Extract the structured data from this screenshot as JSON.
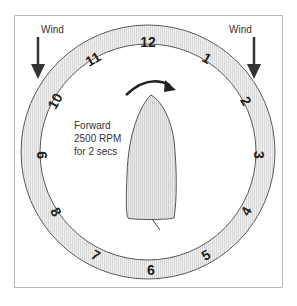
{
  "diagram": {
    "wind_left_label": "Wind",
    "wind_right_label": "Wind",
    "instruction_line1": "Forward",
    "instruction_line2": "2500 RPM",
    "instruction_line3": "for 2 secs",
    "clock_numbers": [
      "12",
      "1",
      "2",
      "3",
      "4",
      "5",
      "6",
      "7",
      "8",
      "9",
      "10",
      "11"
    ],
    "colors": {
      "ring_fill": "#e6e6e6",
      "ring_stroke": "#555555",
      "boat_fill": "#e2e2e2",
      "arrow": "#222222",
      "frame": "#b0b0b0"
    }
  }
}
